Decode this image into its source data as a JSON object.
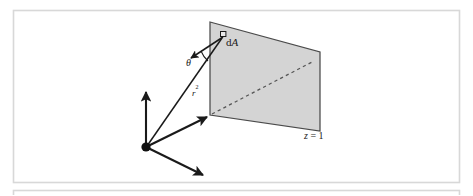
{
  "figure": {
    "caption_alt": "Solid angle subtended by area element dA on the plane z = 1",
    "background_color": "#ffffff",
    "frame": {
      "border_color": "#d8d8d8",
      "outer": {
        "x": 13,
        "y": 10,
        "w": 447,
        "h": 173
      },
      "lower_strip": {
        "x": 13,
        "y": 190,
        "w": 447,
        "h": 5
      }
    },
    "colors": {
      "plane_fill": "#d4d4d4",
      "plane_stroke": "#4a4a4a",
      "line_stroke": "#1a1a1a",
      "dash_stroke": "#555555",
      "axis_stroke": "#1a1a1a"
    },
    "plane": {
      "name": "z = 1",
      "corners": [
        {
          "x": 210,
          "y": 22
        },
        {
          "x": 320,
          "y": 52
        },
        {
          "x": 320,
          "y": 131
        },
        {
          "x": 210,
          "y": 115
        }
      ],
      "diagonal_dashed": {
        "x1": 212,
        "y1": 114,
        "x2": 314,
        "y2": 61
      }
    },
    "origin": {
      "x": 146,
      "y": 147,
      "radius": 4.6
    },
    "axes": [
      {
        "name": "y-axis",
        "x1": 146,
        "y1": 147,
        "x2": 146,
        "y2": 87
      },
      {
        "name": "z-axis",
        "x1": 146,
        "y1": 147,
        "x2": 211,
        "y2": 115
      },
      {
        "name": "x-axis",
        "x1": 146,
        "y1": 147,
        "x2": 206,
        "y2": 177
      }
    ],
    "ray": {
      "name": "r-squared",
      "x1": 146,
      "y1": 147,
      "x2": 223,
      "y2": 37
    },
    "normal": {
      "name": "surface-normal",
      "x1": 223,
      "y1": 37,
      "x2": 188,
      "y2": 60
    },
    "patch": {
      "x": 221,
      "y": 32,
      "size": 5
    },
    "angle_arc": {
      "cx": 223,
      "cy": 37,
      "r": 26,
      "x1": 201,
      "y1": 51,
      "x2": 207,
      "y2": 60
    },
    "labels": {
      "area_element": {
        "text": "d",
        "italic": "A",
        "x": 227,
        "y": 43
      },
      "angle": {
        "text": "θ",
        "x": 190,
        "y": 63
      },
      "distance_squared": {
        "text": "r",
        "sup": "2",
        "x": 194,
        "y": 92
      },
      "plane_position": {
        "pre": "z",
        "eq": " = 1",
        "x": 306,
        "y": 136
      }
    }
  }
}
